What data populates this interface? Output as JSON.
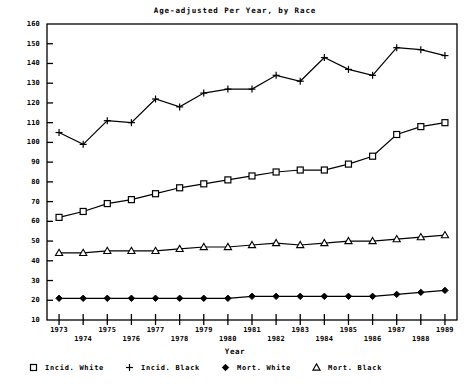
{
  "chart_data": {
    "type": "line",
    "title": "Age-adjusted Per Year, by Race",
    "xlabel": "Year",
    "ylabel": "",
    "xlim": [
      1972.5,
      1989.5
    ],
    "ylim": [
      10,
      160
    ],
    "grid": false,
    "legend_position": "bottom",
    "x": [
      1973,
      1974,
      1975,
      1976,
      1977,
      1978,
      1979,
      1980,
      1981,
      1982,
      1983,
      1984,
      1985,
      1986,
      1987,
      1988,
      1989
    ],
    "xtick_labels": [
      "1973",
      "1974",
      "1975",
      "1976",
      "1977",
      "1978",
      "1979",
      "1980",
      "1981",
      "1982",
      "1983",
      "1984",
      "1985",
      "1986",
      "1987",
      "1988",
      "1989"
    ],
    "ytick_labels": [
      "10",
      "20",
      "30",
      "40",
      "50",
      "60",
      "70",
      "80",
      "90",
      "100",
      "110",
      "120",
      "130",
      "140",
      "150",
      "160"
    ],
    "ytick_values": [
      10,
      20,
      30,
      40,
      50,
      60,
      70,
      80,
      90,
      100,
      110,
      120,
      130,
      140,
      150,
      160
    ],
    "series": [
      {
        "name": "Incid. White",
        "marker": "square",
        "values": [
          62,
          65,
          69,
          71,
          74,
          77,
          79,
          81,
          83,
          85,
          86,
          86,
          89,
          93,
          104,
          108,
          110
        ]
      },
      {
        "name": "Incid. Black",
        "marker": "plus",
        "values": [
          105,
          99,
          111,
          110,
          122,
          118,
          125,
          127,
          127,
          134,
          131,
          143,
          137,
          134,
          148,
          147,
          144
        ]
      },
      {
        "name": "Mort. White",
        "marker": "diamond",
        "values": [
          21,
          21,
          21,
          21,
          21,
          21,
          21,
          21,
          22,
          22,
          22,
          22,
          22,
          22,
          23,
          24,
          25
        ]
      },
      {
        "name": "Mort. Black",
        "marker": "triangle",
        "values": [
          44,
          44,
          45,
          45,
          45,
          46,
          47,
          47,
          48,
          49,
          48,
          49,
          50,
          50,
          51,
          52,
          53
        ]
      }
    ]
  }
}
